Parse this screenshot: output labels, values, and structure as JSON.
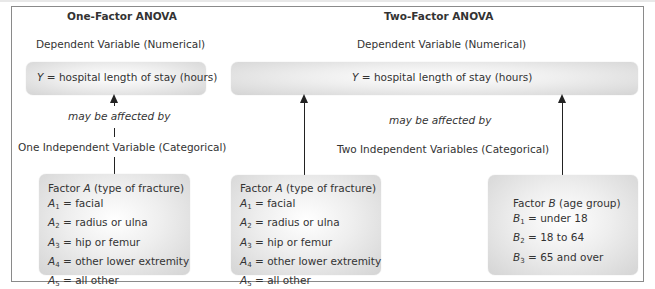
{
  "one_factor": {
    "title": "One-Factor ANOVA",
    "dependent_label": "Dependent Variable (Numerical)",
    "y_box": {
      "var": "Y",
      "text": " = hospital length of stay (hours)"
    },
    "relation": "may be affected by",
    "independent_label": "One Independent Variable (Categorical)",
    "factor_a": {
      "heading_prefix": "Factor ",
      "heading_var": "A",
      "heading_suffix": " (type of fracture)",
      "levels": [
        {
          "var": "A",
          "sub": "1",
          "text": " = facial"
        },
        {
          "var": "A",
          "sub": "2",
          "text": " = radius or ulna"
        },
        {
          "var": "A",
          "sub": "3",
          "text": " = hip or femur"
        },
        {
          "var": "A",
          "sub": "4",
          "text": " = other lower extremity"
        },
        {
          "var": "A",
          "sub": "5",
          "text": " = all other"
        }
      ]
    }
  },
  "two_factor": {
    "title": "Two-Factor ANOVA",
    "dependent_label": "Dependent Variable (Numerical)",
    "y_box": {
      "var": "Y",
      "text": " = hospital length of stay (hours)"
    },
    "relation": "may be affected by",
    "independent_label": "Two Independent Variables (Categorical)",
    "factor_a": {
      "heading_prefix": "Factor ",
      "heading_var": "A",
      "heading_suffix": " (type of fracture)",
      "levels": [
        {
          "var": "A",
          "sub": "1",
          "text": " = facial"
        },
        {
          "var": "A",
          "sub": "2",
          "text": " = radius or ulna"
        },
        {
          "var": "A",
          "sub": "3",
          "text": " = hip or femur"
        },
        {
          "var": "A",
          "sub": "4",
          "text": " = other lower extremity"
        },
        {
          "var": "A",
          "sub": "5",
          "text": " = all other"
        }
      ]
    },
    "factor_b": {
      "heading_prefix": "Factor ",
      "heading_var": "B",
      "heading_suffix": " (age group)",
      "levels": [
        {
          "var": "B",
          "sub": "1",
          "text": " = under 18"
        },
        {
          "var": "B",
          "sub": "2",
          "text": " = 18 to 64"
        },
        {
          "var": "B",
          "sub": "3",
          "text": " = 65 and over"
        }
      ]
    }
  }
}
